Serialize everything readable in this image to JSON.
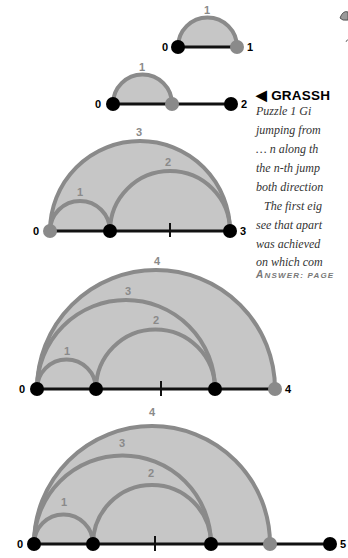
{
  "sidebar_text": {
    "heading_arrow": "◀",
    "heading": "GRASSHOPPER",
    "heading_visible": "GRASSH",
    "lines": [
      "Puzzle 1 Gi",
      "jumping from",
      "… n along th",
      "the n-th jump",
      "both direction",
      "The first eig",
      "see that apart",
      "was achieved",
      "on which com"
    ],
    "answer_label": "ANSWER: PAGE",
    "answer_first": "A",
    "answer_rest": "NSWER: PAGE"
  },
  "diagrams": [
    {
      "name": "n=1",
      "points": [
        "0",
        "1"
      ],
      "jumps": [
        "1"
      ],
      "end_label": "1"
    },
    {
      "name": "n=2",
      "points": [
        "0",
        "1",
        "2"
      ],
      "jumps": [
        "1"
      ],
      "end_label": "2"
    },
    {
      "name": "n=3",
      "points": [
        "0",
        "1",
        "2",
        "3"
      ],
      "jumps": [
        "1",
        "2",
        "3"
      ],
      "end_label": "3"
    },
    {
      "name": "n=4",
      "points": [
        "0",
        "1",
        "2",
        "3",
        "4"
      ],
      "jumps": [
        "1",
        "2",
        "3",
        "4"
      ],
      "end_label": "4"
    },
    {
      "name": "n=5",
      "points": [
        "0",
        "1",
        "2",
        "3",
        "4",
        "5"
      ],
      "jumps": [
        "1",
        "2",
        "3",
        "4"
      ],
      "end_label": "5"
    }
  ],
  "labels": {
    "d1": {
      "start": "0",
      "end": "1",
      "arc1": "1"
    },
    "d2": {
      "start": "0",
      "end": "2",
      "arc1": "1"
    },
    "d3": {
      "start": "0",
      "end": "3",
      "arc1": "1",
      "arc2": "2",
      "arc3": "3"
    },
    "d4": {
      "start": "0",
      "end": "4",
      "arc1": "1",
      "arc2": "2",
      "arc3": "3",
      "arc4": "4"
    },
    "d5": {
      "start": "0",
      "end": "5",
      "arc1": "1",
      "arc2": "2",
      "arc3": "3",
      "arc4": "4"
    }
  },
  "colors": {
    "arc_stroke": "#8a8a8a",
    "arc_fill": "#c6c6c6",
    "dot_black": "#000000",
    "dot_gray": "#8a8a8a",
    "line": "#111111"
  }
}
